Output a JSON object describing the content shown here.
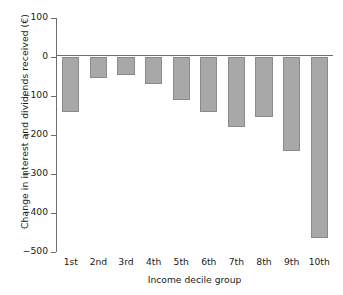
{
  "chart_data": {
    "type": "bar",
    "title": "",
    "xlabel": "Income decile group",
    "ylabel": "Change in interest and dividends received (€)",
    "categories": [
      "1st",
      "2nd",
      "3rd",
      "4th",
      "5th",
      "6th",
      "7th",
      "8th",
      "9th",
      "10th"
    ],
    "values": [
      -140,
      -55,
      -45,
      -68,
      -110,
      -140,
      -180,
      -155,
      -241,
      -464
    ],
    "ylim": [
      -500,
      100
    ],
    "yticks": [
      100,
      0,
      -100,
      -200,
      -300,
      -400,
      -500
    ],
    "ytick_labels": [
      "100",
      "0",
      "−100",
      "−200",
      "−300",
      "−400",
      "−500"
    ],
    "grid": false,
    "legend": false,
    "bar_color": "#a8a8a8",
    "bar_edge_color": "#8a8a8a",
    "axis_color": "#6e6e6e",
    "background": "#ffffff"
  }
}
